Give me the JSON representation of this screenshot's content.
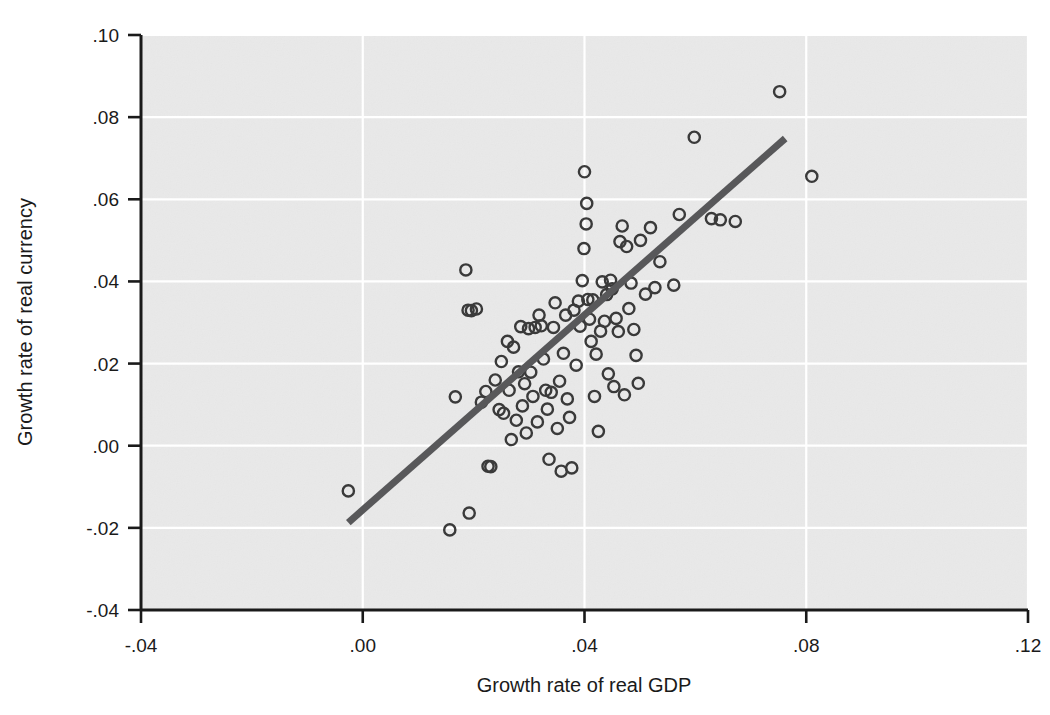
{
  "chart_data": {
    "type": "scatter",
    "title": "",
    "subtitle": "",
    "xlabel": "Growth rate of real GDP",
    "ylabel": "Growth rate of real currency",
    "xlim": [
      -0.04,
      0.12
    ],
    "ylim": [
      -0.04,
      0.1
    ],
    "xticks": [
      -0.04,
      0.0,
      0.04,
      0.08,
      0.12
    ],
    "xtick_labels": [
      "-.04",
      ".00",
      ".04",
      ".08",
      ".12"
    ],
    "yticks": [
      -0.04,
      -0.02,
      0.0,
      0.02,
      0.04,
      0.06,
      0.08,
      0.1
    ],
    "ytick_labels": [
      "-.04",
      "-.02",
      ".00",
      ".02",
      ".04",
      ".06",
      ".08",
      ".10"
    ],
    "grid": true,
    "grid_color": "#ffffff",
    "plot_background": "#e8e8e8",
    "marker": "open-circle",
    "marker_color": "#3a3a3a",
    "legend": null,
    "legend_position": "none",
    "series": [
      {
        "name": "Countries",
        "points": [
          [
            -0.0026,
            -0.011
          ],
          [
            0.0157,
            -0.0205
          ],
          [
            0.0167,
            0.0119
          ],
          [
            0.0186,
            0.0428
          ],
          [
            0.019,
            0.033
          ],
          [
            0.0192,
            -0.0164
          ],
          [
            0.0196,
            0.0329
          ],
          [
            0.0205,
            0.0333
          ],
          [
            0.0214,
            0.0106
          ],
          [
            0.0222,
            0.0132
          ],
          [
            0.0226,
            -0.005
          ],
          [
            0.0231,
            -0.0051
          ],
          [
            0.0239,
            0.016
          ],
          [
            0.0246,
            0.0088
          ],
          [
            0.025,
            0.0205
          ],
          [
            0.0254,
            0.0079
          ],
          [
            0.0261,
            0.0254
          ],
          [
            0.0264,
            0.0135
          ],
          [
            0.0268,
            0.0015
          ],
          [
            0.0272,
            0.024
          ],
          [
            0.0277,
            0.0062
          ],
          [
            0.0281,
            0.018
          ],
          [
            0.0285,
            0.029
          ],
          [
            0.0288,
            0.0097
          ],
          [
            0.0292,
            0.0151
          ],
          [
            0.0295,
            0.0031
          ],
          [
            0.0299,
            0.0285
          ],
          [
            0.0303,
            0.0179
          ],
          [
            0.0307,
            0.012
          ],
          [
            0.0311,
            0.0288
          ],
          [
            0.0315,
            0.0058
          ],
          [
            0.0318,
            0.0318
          ],
          [
            0.0322,
            0.0292
          ],
          [
            0.0326,
            0.0211
          ],
          [
            0.033,
            0.0135
          ],
          [
            0.0333,
            0.0089
          ],
          [
            0.0336,
            -0.0033
          ],
          [
            0.034,
            0.013
          ],
          [
            0.0344,
            0.0288
          ],
          [
            0.0347,
            0.0348
          ],
          [
            0.0351,
            0.0042
          ],
          [
            0.0355,
            0.0157
          ],
          [
            0.0358,
            -0.0062
          ],
          [
            0.0362,
            0.0225
          ],
          [
            0.0366,
            0.0318
          ],
          [
            0.0369,
            0.0114
          ],
          [
            0.0373,
            0.0069
          ],
          [
            0.0377,
            -0.0054
          ],
          [
            0.0381,
            0.033
          ],
          [
            0.0385,
            0.0196
          ],
          [
            0.0389,
            0.0352
          ],
          [
            0.0392,
            0.0291
          ],
          [
            0.0396,
            0.0402
          ],
          [
            0.0399,
            0.048
          ],
          [
            0.04,
            0.0667
          ],
          [
            0.0403,
            0.054
          ],
          [
            0.0404,
            0.059
          ],
          [
            0.0406,
            0.0356
          ],
          [
            0.0409,
            0.0308
          ],
          [
            0.0412,
            0.0254
          ],
          [
            0.0415,
            0.0355
          ],
          [
            0.0418,
            0.012
          ],
          [
            0.0421,
            0.0223
          ],
          [
            0.0425,
            0.0035
          ],
          [
            0.0429,
            0.0279
          ],
          [
            0.0432,
            0.0399
          ],
          [
            0.0436,
            0.0303
          ],
          [
            0.044,
            0.0368
          ],
          [
            0.0443,
            0.0175
          ],
          [
            0.0447,
            0.0403
          ],
          [
            0.045,
            0.0382
          ],
          [
            0.0453,
            0.0144
          ],
          [
            0.0457,
            0.031
          ],
          [
            0.0461,
            0.0278
          ],
          [
            0.0464,
            0.0497
          ],
          [
            0.0468,
            0.0535
          ],
          [
            0.0472,
            0.0124
          ],
          [
            0.0476,
            0.0485
          ],
          [
            0.048,
            0.0334
          ],
          [
            0.0484,
            0.0396
          ],
          [
            0.0489,
            0.0283
          ],
          [
            0.0493,
            0.022
          ],
          [
            0.0497,
            0.0152
          ],
          [
            0.0501,
            0.05
          ],
          [
            0.051,
            0.0369
          ],
          [
            0.0519,
            0.0531
          ],
          [
            0.0527,
            0.0385
          ],
          [
            0.0536,
            0.0448
          ],
          [
            0.0561,
            0.0391
          ],
          [
            0.0571,
            0.0563
          ],
          [
            0.0598,
            0.0751
          ],
          [
            0.0629,
            0.0553
          ],
          [
            0.0645,
            0.055
          ],
          [
            0.0672,
            0.0546
          ],
          [
            0.0752,
            0.0862
          ],
          [
            0.081,
            0.0656
          ]
        ]
      }
    ],
    "trend_line": {
      "name": "Linear fit",
      "color": "#58585a",
      "width_px": 7,
      "x_start": -0.0026,
      "y_start": -0.0187,
      "x_end": 0.0762,
      "y_end": 0.0748
    }
  }
}
